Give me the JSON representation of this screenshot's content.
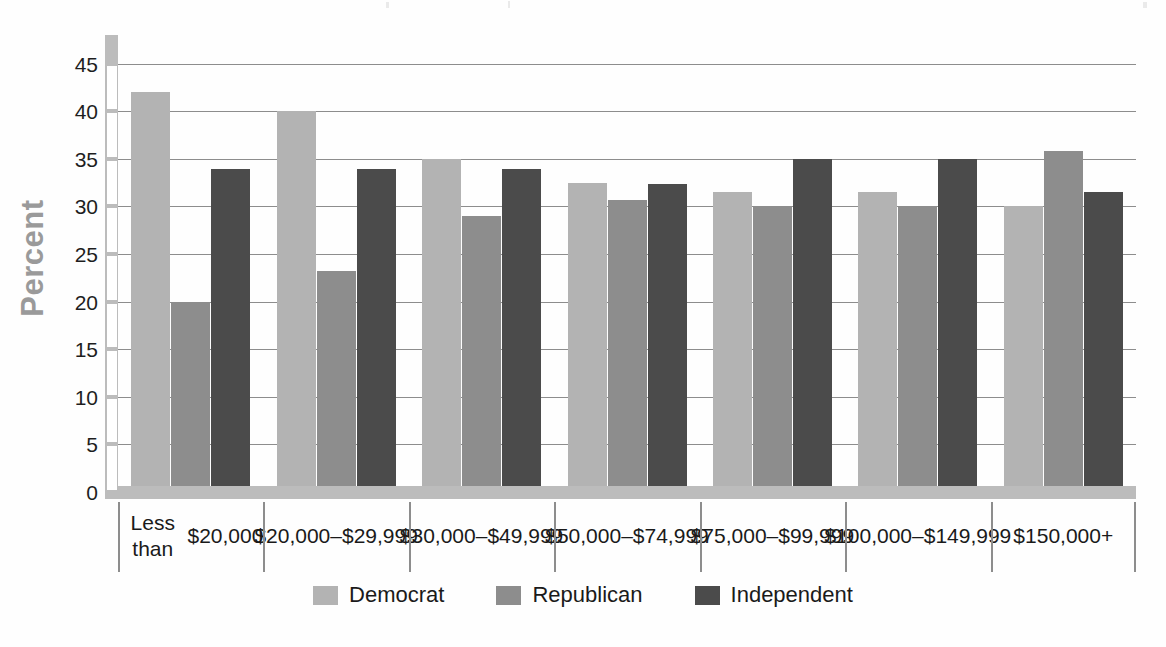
{
  "chart_data": {
    "type": "bar",
    "title": "",
    "subtitle": "",
    "xlabel": "",
    "ylabel": "Percent",
    "ylim": [
      0,
      48
    ],
    "ytick_step": 5,
    "yticks": [
      0,
      5,
      10,
      15,
      20,
      25,
      30,
      35,
      40,
      45
    ],
    "grid": true,
    "legend_position": "bottom-center",
    "categories": [
      "Less than\n$20,000",
      "$20,000–\n$29,999",
      "$30,000–\n$49,999",
      "$50,000–\n$74,999",
      "$75,000–\n$99,999",
      "$100,000–\n$149,999",
      "$150,000+"
    ],
    "category_labels": [
      [
        "Less than",
        "$20,000"
      ],
      [
        "$20,000–",
        "$29,999"
      ],
      [
        "$30,000–",
        "$49,999"
      ],
      [
        "$50,000–",
        "$74,999"
      ],
      [
        "$75,000–",
        "$99,999"
      ],
      [
        "$100,000–",
        "$149,999"
      ],
      [
        "$150,000+",
        ""
      ]
    ],
    "series": [
      {
        "name": "Democrat",
        "color": "#b3b3b3",
        "values": [
          42.0,
          40.0,
          35.0,
          32.5,
          31.5,
          31.5,
          30.0
        ]
      },
      {
        "name": "Republican",
        "color": "#8d8d8d",
        "values": [
          20.0,
          23.2,
          29.0,
          30.7,
          30.0,
          30.0,
          35.8
        ]
      },
      {
        "name": "Independent",
        "color": "#4b4b4b",
        "values": [
          33.9,
          33.9,
          33.9,
          32.4,
          35.0,
          35.0,
          31.5
        ]
      }
    ]
  },
  "axis": {
    "y_title": "Percent",
    "y_title_color": "#9a9a9a",
    "tick_labels": [
      "45",
      "40",
      "35",
      "30",
      "25",
      "20",
      "15",
      "10",
      "5",
      "0"
    ]
  },
  "legend": {
    "items": [
      {
        "label": "Democrat",
        "color": "#b3b3b3"
      },
      {
        "label": "Republican",
        "color": "#8d8d8d"
      },
      {
        "label": "Independent",
        "color": "#4b4b4b"
      }
    ]
  }
}
